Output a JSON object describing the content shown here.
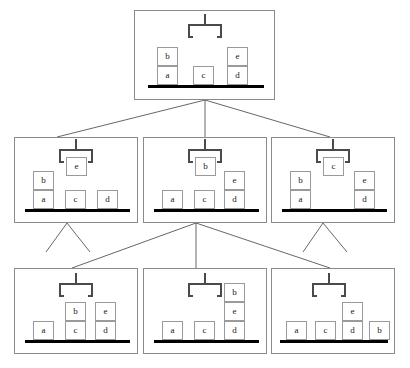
{
  "diagram": {
    "type": "state-space-search-tree",
    "block_labels": [
      "a",
      "b",
      "c",
      "d",
      "e"
    ],
    "colors": {
      "panel_border": "#8a8a8a",
      "block_border": "#9a9a9a",
      "block_fill": "#ffffff",
      "ground": "#000000",
      "gripper": "#4a4a4a",
      "edge": "#555555",
      "background": "#ffffff"
    }
  },
  "levels": [
    {
      "index": 0,
      "name": "root-level",
      "node_count": 1
    },
    {
      "index": 1,
      "name": "middle-level",
      "node_count": 3
    },
    {
      "index": 2,
      "name": "leaf-level",
      "node_count": 3
    }
  ],
  "nodes": [
    {
      "id": "n0",
      "name": "root-state",
      "level": 0,
      "x": 134,
      "y": 10,
      "w": 141,
      "h": 90,
      "gripper": {
        "holding": null,
        "x": 53,
        "y": 12
      },
      "ground": {
        "x": 13,
        "y": 74,
        "w": 116
      },
      "stacks": [
        {
          "x": 22,
          "blocks": [
            "a",
            "b"
          ]
        },
        {
          "x": 58,
          "blocks": [
            "c"
          ]
        },
        {
          "x": 92,
          "blocks": [
            "d",
            "e"
          ]
        }
      ]
    },
    {
      "id": "n1",
      "name": "middle-state-hold-e",
      "level": 1,
      "x": 14,
      "y": 137,
      "w": 124,
      "h": 86,
      "gripper": {
        "holding": "e",
        "x": 44,
        "y": 10
      },
      "ground": {
        "x": 10,
        "y": 71,
        "w": 105
      },
      "stacks": [
        {
          "x": 18,
          "blocks": [
            "a",
            "b"
          ]
        },
        {
          "x": 50,
          "blocks": [
            "c"
          ]
        },
        {
          "x": 82,
          "blocks": [
            "d"
          ]
        }
      ]
    },
    {
      "id": "n2",
      "name": "middle-state-hold-b",
      "level": 1,
      "x": 143,
      "y": 137,
      "w": 124,
      "h": 86,
      "gripper": {
        "holding": "b",
        "x": 44,
        "y": 10
      },
      "ground": {
        "x": 10,
        "y": 71,
        "w": 105
      },
      "stacks": [
        {
          "x": 18,
          "blocks": [
            "a"
          ]
        },
        {
          "x": 50,
          "blocks": [
            "c"
          ]
        },
        {
          "x": 80,
          "blocks": [
            "d",
            "e"
          ]
        }
      ]
    },
    {
      "id": "n3",
      "name": "middle-state-hold-c",
      "level": 1,
      "x": 271,
      "y": 137,
      "w": 124,
      "h": 86,
      "gripper": {
        "holding": "c",
        "x": 44,
        "y": 10
      },
      "ground": {
        "x": 10,
        "y": 71,
        "w": 105
      },
      "stacks": [
        {
          "x": 18,
          "blocks": [
            "a",
            "b"
          ]
        },
        {
          "x": 82,
          "blocks": [
            "d",
            "e"
          ]
        }
      ]
    },
    {
      "id": "n4",
      "name": "leaf-state-b-on-c",
      "level": 2,
      "x": 14,
      "y": 268,
      "w": 124,
      "h": 86,
      "gripper": {
        "holding": null,
        "x": 44,
        "y": 13
      },
      "ground": {
        "x": 10,
        "y": 71,
        "w": 105
      },
      "stacks": [
        {
          "x": 18,
          "blocks": [
            "a"
          ]
        },
        {
          "x": 50,
          "blocks": [
            "c",
            "b"
          ]
        },
        {
          "x": 80,
          "blocks": [
            "d",
            "e"
          ]
        }
      ]
    },
    {
      "id": "n5",
      "name": "leaf-state-b-on-e",
      "level": 2,
      "x": 143,
      "y": 268,
      "w": 124,
      "h": 86,
      "gripper": {
        "holding": null,
        "x": 44,
        "y": 13
      },
      "ground": {
        "x": 10,
        "y": 71,
        "w": 105
      },
      "stacks": [
        {
          "x": 18,
          "blocks": [
            "a"
          ]
        },
        {
          "x": 50,
          "blocks": [
            "c"
          ]
        },
        {
          "x": 80,
          "blocks": [
            "d",
            "e",
            "b"
          ]
        }
      ]
    },
    {
      "id": "n6",
      "name": "leaf-state-b-on-table",
      "level": 2,
      "x": 271,
      "y": 268,
      "w": 124,
      "h": 86,
      "gripper": {
        "holding": null,
        "x": 40,
        "y": 13
      },
      "ground": {
        "x": 8,
        "y": 71,
        "w": 108
      },
      "stacks": [
        {
          "x": 14,
          "blocks": [
            "a"
          ]
        },
        {
          "x": 43,
          "blocks": [
            "c"
          ]
        },
        {
          "x": 70,
          "blocks": [
            "d",
            "e"
          ]
        },
        {
          "x": 97,
          "blocks": [
            "b"
          ]
        }
      ]
    }
  ],
  "edges": [
    {
      "name": "edge-root-to-left",
      "x1": 205,
      "y1": 100,
      "x2": 57,
      "y2": 137
    },
    {
      "name": "edge-root-to-center",
      "x1": 205,
      "y1": 100,
      "x2": 205,
      "y2": 137
    },
    {
      "name": "edge-root-to-right",
      "x1": 205,
      "y1": 100,
      "x2": 330,
      "y2": 137
    },
    {
      "name": "edge-center-to-leaf-1",
      "x1": 196,
      "y1": 223,
      "x2": 72,
      "y2": 268
    },
    {
      "name": "edge-center-to-leaf-2",
      "x1": 196,
      "y1": 223,
      "x2": 196,
      "y2": 268
    },
    {
      "name": "edge-center-to-leaf-3",
      "x1": 196,
      "y1": 223,
      "x2": 330,
      "y2": 268
    }
  ],
  "stub_edges": [
    {
      "name": "stub-left-node-a",
      "x1": 67,
      "y1": 223,
      "x2": 46,
      "y2": 252
    },
    {
      "name": "stub-left-node-b",
      "x1": 67,
      "y1": 223,
      "x2": 90,
      "y2": 252
    },
    {
      "name": "stub-right-node-a",
      "x1": 323,
      "y1": 223,
      "x2": 303,
      "y2": 252
    },
    {
      "name": "stub-right-node-b",
      "x1": 323,
      "y1": 223,
      "x2": 347,
      "y2": 252
    }
  ]
}
